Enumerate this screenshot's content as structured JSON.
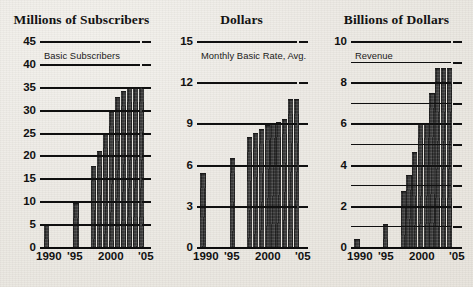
{
  "chart_data": [
    {
      "type": "bar",
      "title": "Millions of Subscribers",
      "annotation": "Basic Subscribers",
      "xlabel": "",
      "ylabel": "",
      "ylim": [
        0,
        45
      ],
      "ytick_step": 5,
      "ytick_labels": [
        "0",
        "5",
        "10",
        "15",
        "20",
        "25",
        "30",
        "35",
        "40",
        "45"
      ],
      "ytick_values": [
        0,
        5,
        10,
        15,
        20,
        25,
        30,
        35,
        40,
        45
      ],
      "grid": true,
      "xtick_labels": [
        "1990",
        "'95",
        "2000",
        "'05"
      ],
      "xtick_years": [
        1990,
        1995,
        2000,
        2005
      ],
      "categories": [
        1990,
        1995,
        1998,
        1999,
        2000,
        2001,
        2002,
        2003,
        2004,
        2005,
        2006
      ],
      "values": [
        5.0,
        9.7,
        17.7,
        21.0,
        25.0,
        29.7,
        32.8,
        34.0,
        35.0,
        35.0,
        35.0
      ]
    },
    {
      "type": "bar",
      "title": "Dollars",
      "annotation": "Monthly Basic Rate, Avg.",
      "xlabel": "",
      "ylabel": "",
      "ylim": [
        0,
        15
      ],
      "ytick_step": 3,
      "ytick_labels": [
        "0",
        "3",
        "6",
        "9",
        "12",
        "15"
      ],
      "ytick_values": [
        0,
        3,
        6,
        9,
        12,
        15
      ],
      "grid": true,
      "xtick_labels": [
        "1990",
        "'95",
        "2000",
        "'05"
      ],
      "xtick_years": [
        1990,
        1995,
        2000,
        2005
      ],
      "categories": [
        1990,
        1995,
        1998,
        1999,
        2000,
        2001,
        2002,
        2003,
        2004,
        2005,
        2006
      ],
      "values": [
        5.4,
        6.5,
        8.0,
        8.3,
        8.6,
        8.9,
        9.0,
        9.1,
        9.3,
        10.8,
        10.8
      ]
    },
    {
      "type": "bar",
      "title": "Billions of Dollars",
      "annotation": "Revenue",
      "xlabel": "",
      "ylabel": "",
      "ylim": [
        0,
        10
      ],
      "ytick_step": 2,
      "ytick_labels": [
        "0",
        "2",
        "4",
        "6",
        "8",
        "10"
      ],
      "ytick_values": [
        0,
        2,
        4,
        6,
        8,
        10
      ],
      "minor_tick_values": [
        1,
        3,
        5,
        7,
        9
      ],
      "grid": true,
      "xtick_labels": [
        "1990",
        "'95",
        "2000",
        "'05"
      ],
      "xtick_years": [
        1990,
        1995,
        2000,
        2005
      ],
      "categories": [
        1990,
        1995,
        1998,
        1999,
        2000,
        2001,
        2002,
        2003,
        2004,
        2005,
        2006
      ],
      "values": [
        0.4,
        1.1,
        2.7,
        3.5,
        4.6,
        6.0,
        6.0,
        7.5,
        8.7,
        8.7,
        8.7
      ]
    }
  ],
  "figure": {
    "background_color": "#edeae4",
    "ink_color": "#111111",
    "bar_color": "#3a3a3a",
    "panel_count": 3
  },
  "panels": [
    {
      "title": "Millions of Subscribers",
      "annotation": "Basic Subscribers"
    },
    {
      "title": "Dollars",
      "annotation": "Monthly Basic Rate, Avg."
    },
    {
      "title": "Billions of Dollars",
      "annotation": "Revenue"
    }
  ]
}
